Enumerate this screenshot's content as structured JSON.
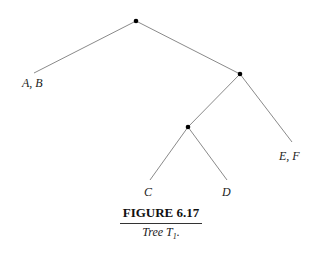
{
  "figure": {
    "title": "FIGURE 6.17",
    "subtitle_text": "Tree T",
    "subtitle_sub": "1",
    "subtitle_end": "."
  },
  "tree": {
    "nodes": [
      {
        "id": "root",
        "x": 136,
        "y": 21
      },
      {
        "id": "right",
        "x": 240,
        "y": 74
      },
      {
        "id": "mid",
        "x": 188,
        "y": 127
      }
    ],
    "edges": [
      {
        "from": [
          136,
          21
        ],
        "to": [
          34,
          73
        ]
      },
      {
        "from": [
          136,
          21
        ],
        "to": [
          240,
          74
        ]
      },
      {
        "from": [
          240,
          74
        ],
        "to": [
          292,
          142
        ]
      },
      {
        "from": [
          240,
          74
        ],
        "to": [
          188,
          127
        ]
      },
      {
        "from": [
          188,
          127
        ],
        "to": [
          150,
          180
        ]
      },
      {
        "from": [
          188,
          127
        ],
        "to": [
          227,
          180
        ]
      }
    ],
    "leaves": [
      {
        "label": "A, B"
      },
      {
        "label": "E, F"
      },
      {
        "label": "C"
      },
      {
        "label": "D"
      }
    ]
  }
}
